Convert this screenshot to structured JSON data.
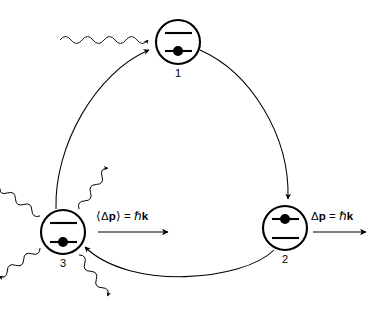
{
  "diagram": {
    "background_color": "#ffffff",
    "stroke_color": "#000000",
    "states": [
      {
        "id": "state-1",
        "number": "1",
        "center_x": 178,
        "center_y": 42,
        "radius": 22,
        "electron_level": "lower",
        "description": "ground state before absorption"
      },
      {
        "id": "state-2",
        "number": "2",
        "center_x": 285,
        "center_y": 228,
        "radius": 22,
        "electron_level": "upper",
        "description": "excited state after photon absorption"
      },
      {
        "id": "state-3",
        "number": "3",
        "center_x": 63,
        "center_y": 232,
        "radius": 22,
        "electron_level": "lower",
        "description": "ground state after spontaneous emission"
      }
    ],
    "labels": [
      {
        "id": "avg-momentum-label",
        "text_parts": [
          "⟨Δ",
          "p",
          "⟩ = ℏ",
          "k"
        ],
        "full_text": "⟨Δp⟩ = ℏk",
        "x": 95,
        "y": 220,
        "has_arrow_below": true
      },
      {
        "id": "momentum-label",
        "text_parts": [
          "Δ",
          "p",
          " = ℏ",
          "k"
        ],
        "full_text": "Δp = ℏk",
        "x": 310,
        "y": 220,
        "has_arrow_below": true
      }
    ],
    "incoming_photon": {
      "id": "incoming-photon-wave",
      "direction": "rightward",
      "target_state": "1",
      "start_x": 60,
      "start_y": 40,
      "end_x": 148,
      "end_y": 40
    },
    "emitted_photons": [
      {
        "id": "emission-up-left",
        "direction": "up-left",
        "angle_deg": 215
      },
      {
        "id": "emission-up-right",
        "direction": "up-right",
        "angle_deg": 305
      },
      {
        "id": "emission-down-left",
        "direction": "down-left",
        "angle_deg": 145
      },
      {
        "id": "emission-down-right",
        "direction": "down-right",
        "angle_deg": 55
      }
    ],
    "cycle_arrows": [
      {
        "id": "arrow-1-to-2",
        "from": "1",
        "to": "2",
        "sweep": "clockwise"
      },
      {
        "id": "arrow-2-to-3",
        "from": "2",
        "to": "3",
        "sweep": "clockwise"
      },
      {
        "id": "arrow-3-to-1",
        "from": "3",
        "to": "1",
        "sweep": "clockwise"
      }
    ]
  }
}
